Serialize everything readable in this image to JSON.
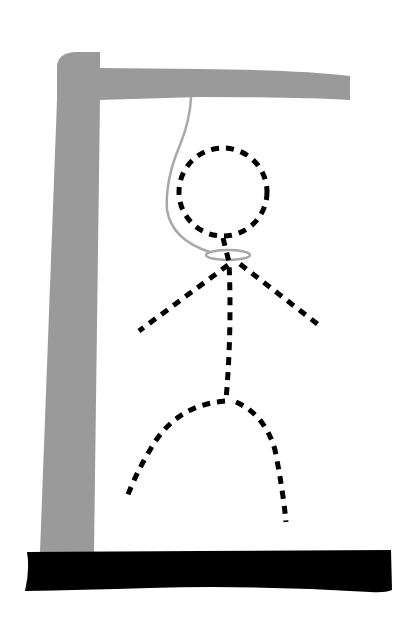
{
  "illustration": {
    "subject": "Hangman drawing",
    "colors": {
      "background": "#ffffff",
      "gallows": "#9a9a9a",
      "rope": "#a8a8a8",
      "figure": "#000000",
      "base": "#000000"
    },
    "parts": {
      "gallows_post": "gallows post",
      "gallows_beam": "gallows beam",
      "base": "ground base",
      "rope": "rope",
      "noose": "noose loop",
      "head": "head (dashed)",
      "body": "body (dashed)",
      "left_arm": "left arm (dashed)",
      "right_arm": "right arm (dashed)",
      "left_leg": "left leg (dashed)",
      "right_leg": "right leg (dashed)"
    }
  }
}
